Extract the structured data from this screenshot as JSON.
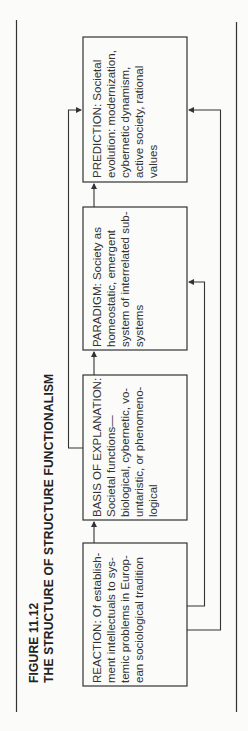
{
  "figure": {
    "label": "FIGURE 11.12",
    "title": "THE STRUCTURE OF STRUCTURE FUNCTIONALISM"
  },
  "boxes": [
    {
      "id": "reaction",
      "lines": [
        "REACTION: Of establish-",
        "ment intellectuals to sys-",
        "temic problems in Europ-",
        "ean sociological tradition"
      ]
    },
    {
      "id": "basis",
      "lines": [
        "BASIS OF EXPLANATION:",
        "Societal functions—",
        "biological, cybernetic, vo-",
        "untaristic, or phenomeno-",
        "logical"
      ]
    },
    {
      "id": "paradigm",
      "lines": [
        "PARADIGM: Society as",
        "homeostatic, emergent",
        "system of interrelated sub-",
        "systems"
      ]
    },
    {
      "id": "prediction",
      "lines": [
        "PREDICTION: Societal",
        "evolution: modernization,",
        "cybernetic dynamism,",
        "active society, rational",
        "values"
      ]
    }
  ],
  "connections": [
    {
      "from": "reaction",
      "to": "basis"
    },
    {
      "from": "basis",
      "to": "paradigm"
    },
    {
      "from": "paradigm",
      "to": "prediction"
    },
    {
      "from": "basis",
      "to": "prediction"
    },
    {
      "from": "reaction",
      "to": "paradigm"
    },
    {
      "from": "reaction",
      "to": "prediction"
    }
  ]
}
